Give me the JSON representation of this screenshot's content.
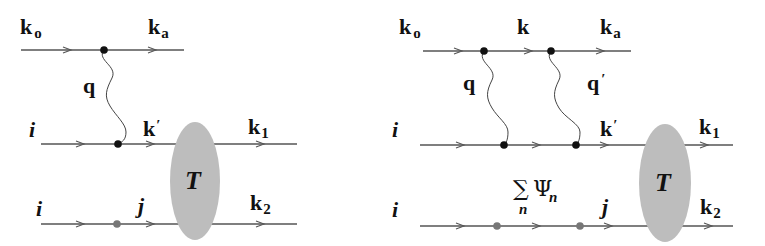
{
  "figure": {
    "left": {
      "labels": {
        "k0": "k",
        "k0_sub": "o",
        "ka": "k",
        "ka_sub": "a",
        "q": "q",
        "i_top": "i",
        "i_bottom": "i",
        "kprime": "k",
        "kprime_mark": "′",
        "k1": "k",
        "k1_sub": "1",
        "k2": "k",
        "k2_sub": "2",
        "j": "j",
        "T": "T"
      }
    },
    "right": {
      "labels": {
        "k0": "k",
        "k0_sub": "o",
        "k": "k",
        "ka": "k",
        "ka_sub": "a",
        "q": "q",
        "qprime": "q",
        "qprime_mark": "′",
        "i_top": "i",
        "i_bottom": "i",
        "kprime": "k",
        "kprime_mark": "′",
        "k1": "k",
        "k1_sub": "1",
        "k2": "k",
        "k2_sub": "2",
        "sum": "∑",
        "sum_sub": "n",
        "psi": "Ψ",
        "psi_sub": "n",
        "j": "j",
        "T": "T"
      }
    },
    "colors": {
      "line": "#555555",
      "vertex": "#111111",
      "gray_vertex": "#777777",
      "blob": "#bdbdbd"
    }
  }
}
